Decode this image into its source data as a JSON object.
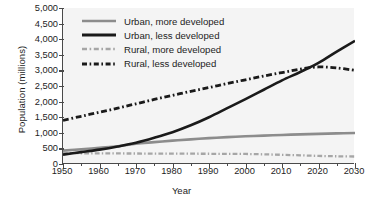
{
  "chart_data": {
    "type": "line",
    "title": "",
    "xlabel": "Year",
    "ylabel": "Population (millions)",
    "xlim": [
      1950,
      2030
    ],
    "ylim": [
      0,
      5000
    ],
    "xticks": [
      1950,
      1960,
      1970,
      1980,
      1990,
      2000,
      2010,
      2020,
      2030
    ],
    "xtick_labels": [
      "1950",
      "1960",
      "1970",
      "1980",
      "1990",
      "2000",
      "2010",
      "2020",
      "2030"
    ],
    "xminor_ticks": [
      1955,
      1965,
      1975,
      1985,
      1995,
      2005,
      2015,
      2025
    ],
    "yticks": [
      0,
      500,
      1000,
      1500,
      2000,
      2500,
      3000,
      3500,
      4000,
      4500,
      5000
    ],
    "ytick_labels": [
      "0",
      "500",
      "1,000",
      "1,500",
      "2,000",
      "2,500",
      "3,000",
      "3,500",
      "4,000",
      "4,500",
      "5,000"
    ],
    "grid": false,
    "legend_position": "upper-left-inside",
    "x": [
      1950,
      1955,
      1960,
      1965,
      1970,
      1975,
      1980,
      1985,
      1990,
      1995,
      2000,
      2005,
      2010,
      2015,
      2020,
      2025,
      2030
    ],
    "series": [
      {
        "name": "Urban, more developed",
        "label": "Urban, more developed",
        "style": "solid",
        "color": "#8c8c8c",
        "width": 2.6,
        "values": [
          430,
          470,
          520,
          570,
          650,
          700,
          750,
          790,
          830,
          860,
          890,
          910,
          930,
          950,
          965,
          980,
          995
        ]
      },
      {
        "name": "Urban, less developed",
        "label": "Urban, less developed",
        "style": "solid",
        "color": "#1a1a1a",
        "width": 2.6,
        "values": [
          300,
          380,
          460,
          560,
          680,
          840,
          1020,
          1240,
          1500,
          1790,
          2080,
          2380,
          2680,
          2950,
          3240,
          3600,
          3950
        ]
      },
      {
        "name": "Rural, more developed",
        "label": "Rural, more developed",
        "style": "dash-dot",
        "color": "#a6a6a6",
        "width": 2.3,
        "values": [
          350,
          345,
          340,
          338,
          336,
          334,
          332,
          330,
          328,
          326,
          322,
          310,
          295,
          278,
          260,
          248,
          240
        ]
      },
      {
        "name": "Rural, less developed",
        "label": "Rural, less developed",
        "style": "dash-dot",
        "color": "#1a1a1a",
        "width": 2.8,
        "values": [
          1400,
          1530,
          1660,
          1790,
          1930,
          2070,
          2200,
          2330,
          2450,
          2580,
          2700,
          2820,
          2930,
          3040,
          3110,
          3080,
          3000
        ]
      }
    ]
  },
  "legend": {
    "items": [
      {
        "label": "Urban, more developed",
        "swatch": "solid-gray-line-swatch"
      },
      {
        "label": "Urban, less developed",
        "swatch": "solid-black-line-swatch"
      },
      {
        "label": "Rural, more developed",
        "swatch": "dashdot-gray-line-swatch"
      },
      {
        "label": "Rural, less developed",
        "swatch": "dashdot-black-line-swatch"
      }
    ]
  }
}
